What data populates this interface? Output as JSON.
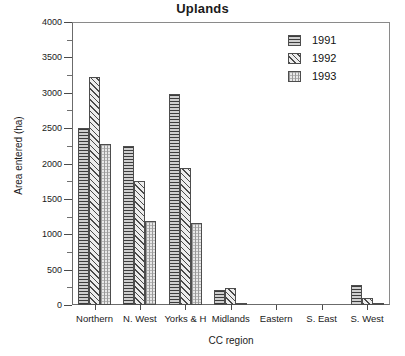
{
  "chart_data": {
    "type": "bar",
    "title": "Uplands",
    "xlabel": "CC region",
    "ylabel": "Area entered (ha)",
    "categories": [
      "Northern",
      "N. West",
      "Yorks & H",
      "Midlands",
      "Eastern",
      "S. East",
      "S. West"
    ],
    "series": [
      {
        "name": "1991",
        "values": [
          2500,
          2250,
          2980,
          210,
          0,
          0,
          280
        ]
      },
      {
        "name": "1992",
        "values": [
          3220,
          1750,
          1940,
          240,
          0,
          0,
          100
        ]
      },
      {
        "name": "1993",
        "values": [
          2270,
          1190,
          1160,
          15,
          0,
          0,
          20
        ]
      }
    ],
    "ylim": [
      0,
      4000
    ],
    "ytick_labels": [
      "0",
      "500",
      "1000",
      "1500",
      "2000",
      "2500",
      "3000",
      "3500",
      "4000"
    ],
    "ytick_values": [
      0,
      500,
      1000,
      1500,
      2000,
      2500,
      3000,
      3500,
      4000
    ],
    "ytick_minor_values": [
      250,
      750,
      1250,
      1750,
      2250,
      2750,
      3250,
      3750
    ],
    "grid": false,
    "legend_position": "top-right",
    "legend_entries": [
      "1991",
      "1992",
      "1993"
    ],
    "series_patterns": [
      "horizontal-lines",
      "diagonal-hatch",
      "fine-dotted"
    ],
    "colors": {
      "axis": "#4a4a4a",
      "frame": "#6b6b6b",
      "text": "#1a1a1a",
      "series_1991": "#9b9b9b",
      "series_1992": "#e2e2e2",
      "series_1993": "#e8e8e8"
    }
  }
}
